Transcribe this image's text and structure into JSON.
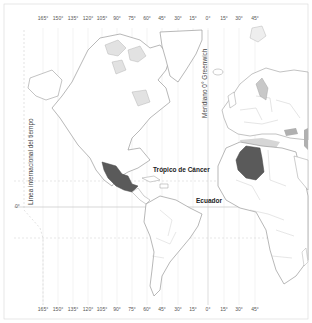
{
  "map": {
    "top_longitude_ticks": [
      "165°",
      "150°",
      "135°",
      "120°",
      "105°",
      "90°",
      "75°",
      "60°",
      "45°",
      "30°",
      "15°",
      "0°",
      "15°",
      "30°",
      "45°"
    ],
    "bottom_longitude_ticks": [
      "165°",
      "150°",
      "135°",
      "120°",
      "105°",
      "90°",
      "75°",
      "60°",
      "45°",
      "30°",
      "15°",
      "0°",
      "15°",
      "30°",
      "45°"
    ],
    "tick_x_positions": [
      43,
      58,
      73,
      88,
      102,
      117,
      132,
      147,
      162,
      178,
      193,
      208,
      224,
      239,
      255
    ],
    "equator_tick": "0°",
    "labels": {
      "date_line": "Línea internacional del tiempo",
      "greenwich": "Meridiano 0° Greenwich",
      "tropic_of_cancer": "Trópico de Cáncer",
      "equator": "Ecuador"
    },
    "highlighted_countries": [
      {
        "name": "Mexico",
        "color": "#555555"
      },
      {
        "name": "Algeria",
        "color": "#555555"
      }
    ],
    "colors": {
      "land_outline": "#9a9a9a",
      "land_fill": "#ffffff",
      "highlight": "#5a5a5a",
      "secondary_shade": "#b8b8b8",
      "grid": "#e2e2e2",
      "reference_line": "#c8c8c8"
    }
  }
}
